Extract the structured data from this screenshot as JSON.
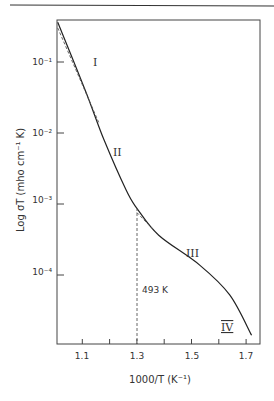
{
  "chart_data": {
    "type": "line",
    "title": "",
    "xlabel": "1000/T (K⁻¹)",
    "ylabel": "Log σT (mho cm⁻¹ K)",
    "xlim": [
      1.0,
      1.75
    ],
    "ylim_log10": [
      -5,
      -0.4
    ],
    "yscale": "log",
    "x_ticks": [
      1.1,
      1.2,
      1.3,
      1.4,
      1.5,
      1.6,
      1.7
    ],
    "x_tick_labels": [
      "1.1",
      "1.3",
      "1.5",
      "1.7"
    ],
    "y_ticks_log10": [
      -1,
      -2,
      -3,
      -4
    ],
    "y_tick_labels": [
      "10⁻¹",
      "10⁻²",
      "10⁻³",
      "10⁻⁴"
    ],
    "grid": false,
    "series": [
      {
        "name": "measured",
        "style": "solid",
        "x": [
          1.01,
          1.11,
          1.18,
          1.26,
          1.3,
          1.38,
          1.53,
          1.64,
          1.72
        ],
        "log10_y": [
          -0.44,
          -1.39,
          -2.1,
          -2.8,
          -3.06,
          -3.44,
          -3.86,
          -4.28,
          -4.85
        ]
      },
      {
        "name": "extrapolation-high-T",
        "style": "dashed",
        "x": [
          1.01,
          1.16
        ],
        "log10_y": [
          -0.52,
          -1.85
        ]
      },
      {
        "name": "extrapolation-III",
        "style": "dashed",
        "x": [
          1.3,
          1.38
        ],
        "log10_y": [
          -3.12,
          -3.44
        ]
      }
    ],
    "annotations": [
      {
        "text": "I",
        "x": 1.14,
        "log10_y": -1.0
      },
      {
        "text": "II",
        "x": 1.22,
        "log10_y": -2.1
      },
      {
        "text": "III",
        "x": 1.55,
        "log10_y": -3.65
      },
      {
        "text": "IV",
        "x": 1.66,
        "log10_y": -4.75
      },
      {
        "text": "493 K",
        "x": 1.31,
        "log10_y": -4.1,
        "note": "vertical dashed line at 1000/T = 1.30"
      }
    ]
  },
  "labels": {
    "roman_I": "I",
    "roman_II": "II",
    "roman_III": "III",
    "roman_IV": "IV",
    "transition": "493 K",
    "xlabel": "1000/T (K⁻¹)",
    "ylabel": "Log σT (mho cm⁻¹ K)",
    "xt_1": "1.1",
    "xt_3": "1.3",
    "xt_5": "1.5",
    "xt_7": "1.7",
    "yt_1": "10⁻¹",
    "yt_2": "10⁻²",
    "yt_3": "10⁻³",
    "yt_4": "10⁻⁴"
  }
}
